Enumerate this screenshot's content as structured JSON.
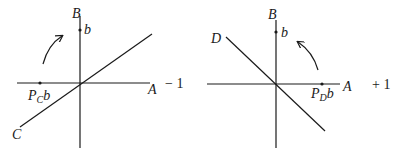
{
  "panels": [
    {
      "id": "left",
      "axis_labels": {
        "vertical": "B",
        "horizontal": "A",
        "line": "C"
      },
      "point_vertical_label": "b",
      "projection_label_main": "P",
      "projection_label_sub": "C",
      "projection_label_tail": "b",
      "sign_label": "− 1",
      "rotation": "counterclockwise"
    },
    {
      "id": "right",
      "axis_labels": {
        "vertical": "B",
        "horizontal": "A",
        "line": "D"
      },
      "point_vertical_label": "b",
      "projection_label_main": "P",
      "projection_label_sub": "D",
      "projection_label_tail": "b",
      "sign_label": "+ 1",
      "rotation": "counterclockwise"
    }
  ],
  "colors": {
    "ink": "#1a1a1a",
    "background": "#ffffff"
  }
}
